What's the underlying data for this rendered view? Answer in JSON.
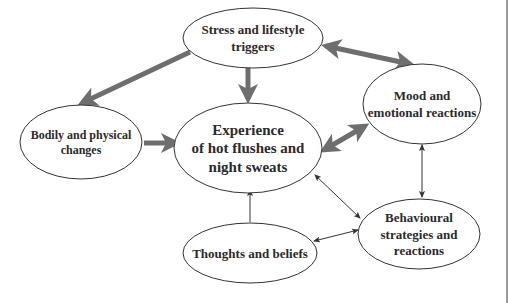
{
  "diagram": {
    "nodes": [
      {
        "id": "stress",
        "lines": [
          "Stress and  lifestyle",
          "triggers"
        ]
      },
      {
        "id": "bodily",
        "lines": [
          "Bodily and physical",
          "changes"
        ]
      },
      {
        "id": "experience",
        "lines": [
          "Experience",
          "of  hot flushes and",
          "night sweats"
        ]
      },
      {
        "id": "mood",
        "lines": [
          "Mood and",
          "emotional reactions"
        ]
      },
      {
        "id": "behaviour",
        "lines": [
          "Behavioural",
          "strategies and",
          "reactions"
        ]
      },
      {
        "id": "thoughts",
        "lines": [
          "Thoughts and beliefs"
        ]
      }
    ],
    "edges": [
      {
        "from": "stress",
        "to": "bodily",
        "weight": "thick",
        "direction": "forward"
      },
      {
        "from": "stress",
        "to": "experience",
        "weight": "thick",
        "direction": "forward"
      },
      {
        "from": "stress",
        "to": "mood",
        "weight": "thick",
        "direction": "both"
      },
      {
        "from": "bodily",
        "to": "experience",
        "weight": "thick",
        "direction": "forward"
      },
      {
        "from": "experience",
        "to": "mood",
        "weight": "thick",
        "direction": "both"
      },
      {
        "from": "mood",
        "to": "behaviour",
        "weight": "thin",
        "direction": "both"
      },
      {
        "from": "behaviour",
        "to": "experience",
        "weight": "thin",
        "direction": "both"
      },
      {
        "from": "thoughts",
        "to": "experience",
        "weight": "thin",
        "direction": "forward"
      },
      {
        "from": "behaviour",
        "to": "thoughts",
        "weight": "thin",
        "direction": "both"
      }
    ]
  }
}
